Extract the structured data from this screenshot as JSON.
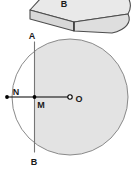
{
  "figure": {
    "title": "",
    "colors": {
      "shade": "#e2e2e2",
      "solid_top": "#e8e8e8",
      "solid_front": "#dcdcdc",
      "stroke": "#555555",
      "line": "#000000",
      "label": "#1a1a1a",
      "background": "#ffffff"
    },
    "solid": {
      "name": "curved-wedge-solid",
      "label_b": "B"
    },
    "circle": {
      "center": {
        "x": 70,
        "y": 97
      },
      "radius": 58,
      "shaded_side": "right-of-chord"
    },
    "chord": {
      "name": "chord-AB",
      "x": 34,
      "top_label": "A",
      "bottom_label": "B"
    },
    "points": [
      {
        "id": "N",
        "label": "N",
        "x": 7,
        "y": 97
      },
      {
        "id": "M",
        "label": "M",
        "x": 34,
        "y": 97
      },
      {
        "id": "O",
        "label": "O",
        "x": 70,
        "y": 97
      }
    ],
    "segment_line": {
      "name": "segment-NO",
      "from": "N",
      "to": "O"
    }
  }
}
